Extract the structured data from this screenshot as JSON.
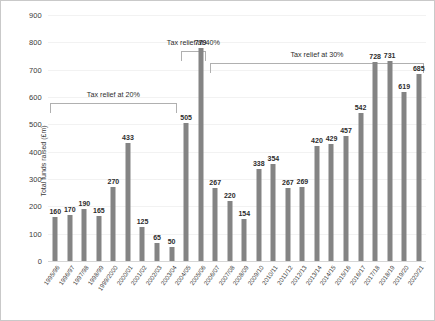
{
  "chart_data": {
    "type": "bar",
    "title": "",
    "xlabel": "",
    "ylabel": "Total funds raised (£m)",
    "ylim": [
      0,
      900
    ],
    "ytick_step": 100,
    "yticks": [
      900,
      800,
      700,
      600,
      500,
      400,
      300,
      200,
      100,
      0
    ],
    "grid": true,
    "legend": "none",
    "bar_color": "#848484",
    "categories": [
      "1995/96",
      "1996/97",
      "1997/98",
      "1998/99",
      "1999/2000",
      "2000/01",
      "2001/02",
      "2002/03",
      "2003/04",
      "2004/05",
      "2005/06",
      "2006/07",
      "2007/08",
      "2008/09",
      "2009/10",
      "2010/11",
      "2011/12",
      "2012/13",
      "2013/14",
      "2014/15",
      "2015/16",
      "2016/17",
      "2017/18",
      "2018/19",
      "2019/20",
      "2020/21"
    ],
    "values": [
      160,
      170,
      190,
      165,
      270,
      433,
      125,
      65,
      50,
      505,
      779,
      267,
      220,
      154,
      338,
      354,
      267,
      269,
      420,
      429,
      457,
      542,
      728,
      731,
      619,
      685
    ],
    "annotations": [
      {
        "label": "Tax relief at 20%",
        "start_category": "1995/96",
        "end_category": "2003/04"
      },
      {
        "label": "Tax relief at 40%",
        "start_category": "2004/05",
        "end_category": "2005/06"
      },
      {
        "label": "Tax relief at 30%",
        "start_category": "2006/07",
        "end_category": "2020/21"
      }
    ]
  }
}
